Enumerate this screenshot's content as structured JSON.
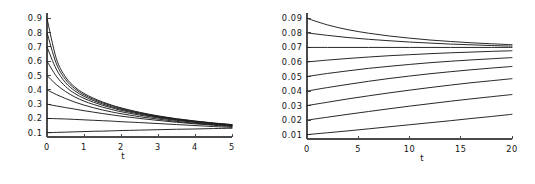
{
  "figure": {
    "background_color": "#ffffff",
    "curve_color": "#1c1c1c",
    "axis_color": "#4a4a4a",
    "panel_count": 2
  },
  "chart_data": [
    {
      "type": "line",
      "title": "",
      "subtitle": "",
      "xlabel": "t",
      "ylabel": "",
      "xlim": [
        0,
        5
      ],
      "ylim": [
        0.07,
        0.93
      ],
      "xticks": [
        0,
        1,
        2,
        3,
        4,
        5
      ],
      "xticklabels": [
        "0",
        "1",
        "2",
        "3",
        "4",
        "5"
      ],
      "yticks": [
        0.1,
        0.2,
        0.3,
        0.4,
        0.5,
        0.6,
        0.7,
        0.8,
        0.9
      ],
      "yticklabels": [
        "0.1",
        "0.2",
        "0.3",
        "0.4",
        "0.5",
        "0.6",
        "0.7",
        "0.8",
        "0.9"
      ],
      "grid": false,
      "legend": false,
      "legend_position": "none",
      "annotations": [],
      "x": [
        0,
        0.25,
        0.5,
        0.75,
        1,
        1.25,
        1.5,
        1.75,
        2,
        2.5,
        3,
        3.5,
        4,
        4.5,
        5
      ],
      "series": [
        {
          "name": "y0 = 0.9",
          "initial_value": 0.9,
          "values": [
            0.9,
            0.62,
            0.49,
            0.42,
            0.375,
            0.342,
            0.315,
            0.293,
            0.274,
            0.243,
            0.218,
            0.198,
            0.182,
            0.168,
            0.157
          ]
        },
        {
          "name": "y0 = 0.8",
          "initial_value": 0.8,
          "values": [
            0.8,
            0.585,
            0.472,
            0.408,
            0.365,
            0.334,
            0.309,
            0.288,
            0.269,
            0.239,
            0.215,
            0.196,
            0.18,
            0.167,
            0.156
          ]
        },
        {
          "name": "y0 = 0.7",
          "initial_value": 0.7,
          "values": [
            0.7,
            0.545,
            0.45,
            0.393,
            0.354,
            0.325,
            0.301,
            0.281,
            0.264,
            0.235,
            0.212,
            0.193,
            0.178,
            0.165,
            0.154
          ]
        },
        {
          "name": "y0 = 0.6",
          "initial_value": 0.6,
          "values": [
            0.6,
            0.496,
            0.423,
            0.374,
            0.34,
            0.314,
            0.292,
            0.274,
            0.257,
            0.23,
            0.208,
            0.19,
            0.175,
            0.163,
            0.152
          ]
        },
        {
          "name": "y0 = 0.5",
          "initial_value": 0.5,
          "values": [
            0.5,
            0.437,
            0.388,
            0.35,
            0.321,
            0.298,
            0.279,
            0.262,
            0.247,
            0.223,
            0.203,
            0.186,
            0.172,
            0.16,
            0.15
          ]
        },
        {
          "name": "y0 = 0.4",
          "initial_value": 0.4,
          "values": [
            0.4,
            0.367,
            0.339,
            0.314,
            0.293,
            0.275,
            0.259,
            0.245,
            0.233,
            0.212,
            0.195,
            0.179,
            0.166,
            0.156,
            0.146
          ]
        },
        {
          "name": "y0 = 0.3",
          "initial_value": 0.3,
          "values": [
            0.3,
            0.287,
            0.276,
            0.265,
            0.254,
            0.244,
            0.234,
            0.225,
            0.216,
            0.2,
            0.186,
            0.173,
            0.162,
            0.152,
            0.143
          ]
        },
        {
          "name": "y0 = 0.2",
          "initial_value": 0.2,
          "values": [
            0.2,
            0.198,
            0.196,
            0.193,
            0.19,
            0.187,
            0.184,
            0.181,
            0.177,
            0.171,
            0.164,
            0.157,
            0.15,
            0.143,
            0.137
          ]
        },
        {
          "name": "y0 = 0.1",
          "initial_value": 0.1,
          "values": [
            0.1,
            0.102,
            0.104,
            0.106,
            0.108,
            0.11,
            0.111,
            0.113,
            0.115,
            0.118,
            0.121,
            0.124,
            0.126,
            0.129,
            0.131
          ]
        }
      ]
    },
    {
      "type": "line",
      "title": "",
      "subtitle": "",
      "xlabel": "t",
      "ylabel": "",
      "xlim": [
        0,
        20
      ],
      "ylim": [
        0.007,
        0.093
      ],
      "xticks": [
        0,
        5,
        10,
        15,
        20
      ],
      "xticklabels": [
        "0",
        "5",
        "10",
        "15",
        "20"
      ],
      "yticks": [
        0.01,
        0.02,
        0.03,
        0.04,
        0.05,
        0.06,
        0.07,
        0.08,
        0.09
      ],
      "yticklabels": [
        "0.01",
        "0.02",
        "0.03",
        "0.04",
        "0.05",
        "0.06",
        "0.07",
        "0.08",
        "0.09"
      ],
      "grid": false,
      "legend": false,
      "legend_position": "none",
      "annotations": [],
      "x": [
        0,
        2,
        4,
        6,
        8,
        10,
        12,
        14,
        16,
        18,
        20
      ],
      "series": [
        {
          "name": "y0 = 0.09",
          "initial_value": 0.09,
          "values": [
            0.09,
            0.0855,
            0.0822,
            0.0798,
            0.0779,
            0.0764,
            0.0751,
            0.0741,
            0.0732,
            0.0725,
            0.0719
          ]
        },
        {
          "name": "y0 = 0.08",
          "initial_value": 0.08,
          "values": [
            0.08,
            0.0783,
            0.0768,
            0.0756,
            0.0746,
            0.0737,
            0.073,
            0.0723,
            0.0718,
            0.0713,
            0.0709
          ]
        },
        {
          "name": "y0 = 0.07",
          "initial_value": 0.07,
          "values": [
            0.07,
            0.07,
            0.07,
            0.07,
            0.07,
            0.07,
            0.07,
            0.07,
            0.07,
            0.07,
            0.07
          ]
        },
        {
          "name": "y0 = 0.06",
          "initial_value": 0.06,
          "values": [
            0.06,
            0.0613,
            0.0624,
            0.0634,
            0.0643,
            0.065,
            0.0657,
            0.0663,
            0.0668,
            0.0673,
            0.0677
          ]
        },
        {
          "name": "y0 = 0.05",
          "initial_value": 0.05,
          "values": [
            0.05,
            0.0521,
            0.0539,
            0.0556,
            0.057,
            0.0583,
            0.0595,
            0.0605,
            0.0614,
            0.0622,
            0.063
          ]
        },
        {
          "name": "y0 = 0.04",
          "initial_value": 0.04,
          "values": [
            0.04,
            0.0424,
            0.0446,
            0.0467,
            0.0486,
            0.0503,
            0.0519,
            0.0533,
            0.0546,
            0.0558,
            0.0569
          ]
        },
        {
          "name": "y0 = 0.03",
          "initial_value": 0.03,
          "values": [
            0.03,
            0.0323,
            0.0346,
            0.0367,
            0.0387,
            0.0406,
            0.0424,
            0.0441,
            0.0457,
            0.0471,
            0.0485
          ]
        },
        {
          "name": "y0 = 0.02",
          "initial_value": 0.02,
          "values": [
            0.02,
            0.022,
            0.024,
            0.0259,
            0.0278,
            0.0296,
            0.0313,
            0.033,
            0.0346,
            0.0361,
            0.0376
          ]
        },
        {
          "name": "y0 = 0.01",
          "initial_value": 0.01,
          "values": [
            0.01,
            0.0113,
            0.0126,
            0.014,
            0.0154,
            0.0168,
            0.0182,
            0.0196,
            0.0211,
            0.0225,
            0.024
          ]
        }
      ]
    }
  ]
}
